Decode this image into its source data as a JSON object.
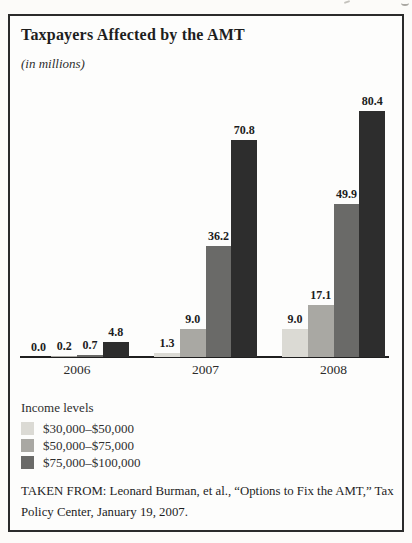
{
  "page": {
    "title": "Taxpayers Affected by the AMT",
    "subtitle": "(in millions)",
    "caption_lines": [
      "TAKEN FROM: Leonard Burman, et al., “Options to Fix the AMT,” Tax",
      "Policy Center, January 19, 2007."
    ]
  },
  "legend": {
    "title": "Income levels",
    "items": [
      {
        "label": "$30,000–$50,000",
        "color": "#dbdad4"
      },
      {
        "label": "$50,000–$75,000",
        "color": "#a9a8a3"
      },
      {
        "label": "$75,000–$100,000",
        "color": "#6a6a68"
      }
    ]
  },
  "chart_data": {
    "type": "bar",
    "title": "Taxpayers Affected by the AMT",
    "units_note": "(in millions)",
    "categories": [
      "2006",
      "2007",
      "2008"
    ],
    "series": [
      {
        "name": "$30,000–$50,000",
        "color": "#dbdad4",
        "values": [
          0.0,
          1.3,
          9.0
        ]
      },
      {
        "name": "$50,000–$75,000",
        "color": "#a9a8a3",
        "values": [
          0.2,
          9.0,
          17.1
        ]
      },
      {
        "name": "$75,000–$100,000",
        "color": "#6a6a68",
        "values": [
          0.7,
          36.2,
          49.9
        ]
      },
      {
        "name": "",
        "color": "#2d2d2d",
        "values": [
          4.8,
          70.8,
          80.4
        ]
      }
    ],
    "value_labels_shown": true,
    "xlabel": "",
    "ylabel": "",
    "ylim": [
      0,
      85
    ],
    "grid": false,
    "y_axis_shown": false,
    "legend_title": "Income levels",
    "legend_position": "below-left",
    "source_caption": "TAKEN FROM: Leonard Burman, et al., “Options to Fix the AMT,” Tax Policy Center, January 19, 2007."
  }
}
